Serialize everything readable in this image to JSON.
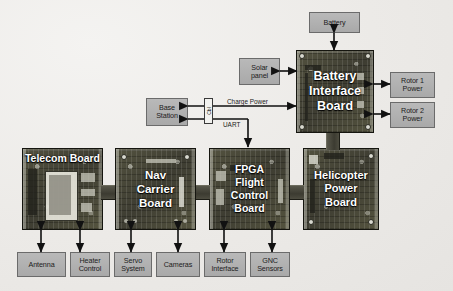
{
  "diagram": {
    "background_color": "#eceae7",
    "board_text_color": "#ffffff",
    "label_box_color": "#b0b0b0",
    "label_border_color": "#6b6b6b"
  },
  "boards": [
    {
      "id": "telecom",
      "name": "Telecom Board",
      "lines": [
        "Telecom Board"
      ]
    },
    {
      "id": "nav",
      "name": "Nav Carrier Board",
      "lines": [
        "Nav",
        "Carrier",
        "Board"
      ]
    },
    {
      "id": "fpga",
      "name": "FPGA Flight Control Board",
      "lines": [
        "FPGA",
        "Flight",
        "Control",
        "Board"
      ]
    },
    {
      "id": "helipower",
      "name": "Helicopter Power Board",
      "lines": [
        "Helicopter",
        "Power",
        "Board"
      ]
    },
    {
      "id": "battif",
      "name": "Battery Interface Board",
      "lines": [
        "Battery",
        "Interface",
        "Board"
      ]
    }
  ],
  "peripherals": {
    "battery": {
      "lines": [
        "Battery"
      ]
    },
    "solar_panel": {
      "lines": [
        "Solar",
        "panel"
      ]
    },
    "rotor1_power": {
      "lines": [
        "Rotor 1",
        "Power"
      ]
    },
    "rotor2_power": {
      "lines": [
        "Rotor 2",
        "Power"
      ]
    },
    "base_station": {
      "lines": [
        "Base",
        "Station"
      ]
    },
    "antenna": {
      "lines": [
        "Antenna"
      ]
    },
    "heater_control": {
      "lines": [
        "Heater",
        "Control"
      ]
    },
    "servo_system": {
      "lines": [
        "Servo",
        "System"
      ]
    },
    "cameras": {
      "lines": [
        "Cameras"
      ]
    },
    "rotor_interface": {
      "lines": [
        "Rotor",
        "Interface"
      ]
    },
    "gnc_sensors": {
      "lines": [
        "GNC",
        "Sensors"
      ]
    }
  },
  "wire_labels": {
    "charge_power": "Charge Power",
    "uart": "UART",
    "cable_connector": "Cbl"
  }
}
